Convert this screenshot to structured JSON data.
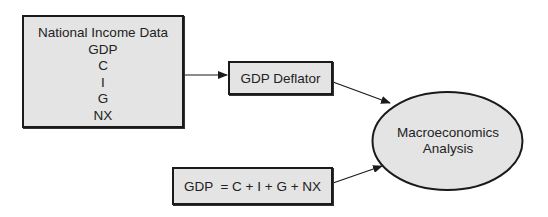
{
  "diagram": {
    "nodes": {
      "national_income": {
        "title": "National Income Data",
        "items": [
          "GDP",
          "C",
          "I",
          "G",
          "NX"
        ]
      },
      "gdp_deflator": {
        "label": "GDP Deflator"
      },
      "equation": {
        "label": "GDP  = C + I + G + NX"
      },
      "macro_analysis": {
        "line1": "Macroeconomics",
        "line2": "Analysis"
      }
    },
    "edges": [
      {
        "from": "National Income Data",
        "to": "GDP Deflator"
      },
      {
        "from": "GDP Deflator",
        "to": "Macroeconomics Analysis"
      },
      {
        "from": "GDP = C + I + G + NX",
        "to": "Macroeconomics Analysis"
      }
    ],
    "colors": {
      "node_fill": "#e4e4e4",
      "stroke": "#1a1a1a",
      "background": "#ffffff"
    }
  }
}
